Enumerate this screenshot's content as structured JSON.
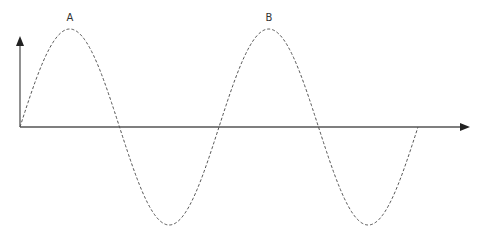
{
  "diagram": {
    "type": "sine-wave",
    "labels": {
      "peak_a": "A",
      "peak_b": "B"
    },
    "colors": {
      "axis": "#555555",
      "wave": "#555555",
      "label": "#333333"
    },
    "wave": {
      "cycles": 2,
      "start_x": 20,
      "end_x": 418,
      "baseline_y": 127,
      "amplitude": 98,
      "style": "dashed"
    }
  }
}
